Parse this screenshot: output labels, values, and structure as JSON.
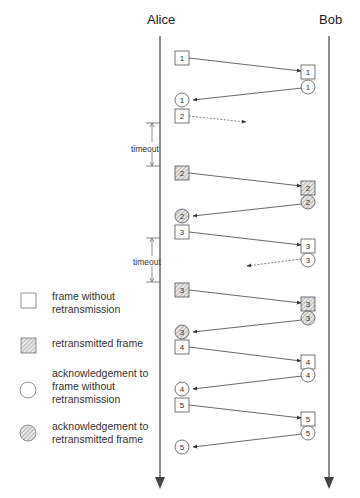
{
  "actors": {
    "alice": "Alice",
    "bob": "Bob"
  },
  "timeouts": [
    {
      "label": "timeout"
    },
    {
      "label": "timeout"
    }
  ],
  "legend": [
    {
      "symbol": "square",
      "label": "frame without retransmission"
    },
    {
      "symbol": "hatched-square",
      "label": "retransmitted frame"
    },
    {
      "symbol": "circle",
      "label": "acknowledgement to frame without retransmission"
    },
    {
      "symbol": "hatched-circle",
      "label": "acknowledgement to retransmitted frame"
    }
  ],
  "messages": [
    {
      "from": "Alice",
      "to": "Bob",
      "type": "frame",
      "seq": "1",
      "retransmitted": false,
      "lost": false
    },
    {
      "from": "Bob",
      "to": "Alice",
      "type": "ack",
      "seq": "1",
      "retransmitted": false,
      "lost": false
    },
    {
      "from": "Alice",
      "to": "Bob",
      "type": "frame",
      "seq": "2",
      "retransmitted": false,
      "lost": true
    },
    {
      "from": "Alice",
      "to": "Bob",
      "type": "frame",
      "seq": "2",
      "retransmitted": true,
      "lost": false
    },
    {
      "from": "Bob",
      "to": "Alice",
      "type": "ack",
      "seq": "2",
      "retransmitted": true,
      "lost": false
    },
    {
      "from": "Alice",
      "to": "Bob",
      "type": "frame",
      "seq": "3",
      "retransmitted": false,
      "lost": false
    },
    {
      "from": "Bob",
      "to": "Alice",
      "type": "ack",
      "seq": "3",
      "retransmitted": false,
      "lost": true
    },
    {
      "from": "Alice",
      "to": "Bob",
      "type": "frame",
      "seq": "3",
      "retransmitted": true,
      "lost": false
    },
    {
      "from": "Bob",
      "to": "Alice",
      "type": "ack",
      "seq": "3",
      "retransmitted": true,
      "lost": false
    },
    {
      "from": "Alice",
      "to": "Bob",
      "type": "frame",
      "seq": "4",
      "retransmitted": false,
      "lost": false
    },
    {
      "from": "Bob",
      "to": "Alice",
      "type": "ack",
      "seq": "4",
      "retransmitted": false,
      "lost": false
    },
    {
      "from": "Alice",
      "to": "Bob",
      "type": "frame",
      "seq": "5",
      "retransmitted": false,
      "lost": false
    },
    {
      "from": "Bob",
      "to": "Alice",
      "type": "ack",
      "seq": "5",
      "retransmitted": false,
      "lost": false
    }
  ],
  "labels": {
    "f1a": "1",
    "f1b": "1",
    "a1b": "1",
    "a1a": "1",
    "f2a": "2",
    "f2ra": "2",
    "f2rb": "2",
    "a2rb": "2",
    "a2ra": "2",
    "f3a": "3",
    "f3b": "3",
    "a3b": "3",
    "f3ra": "3",
    "f3rb": "3",
    "a3rb": "3",
    "a3ra": "3",
    "f4a": "4",
    "f4b": "4",
    "a4b": "4",
    "a4a": "4",
    "f5a": "5",
    "f5b": "5",
    "a5b": "5",
    "a5a": "5"
  },
  "colors": {
    "line": "#444444",
    "lost_line": "#666666",
    "hatch": "#999999",
    "box_border": "#555555"
  }
}
